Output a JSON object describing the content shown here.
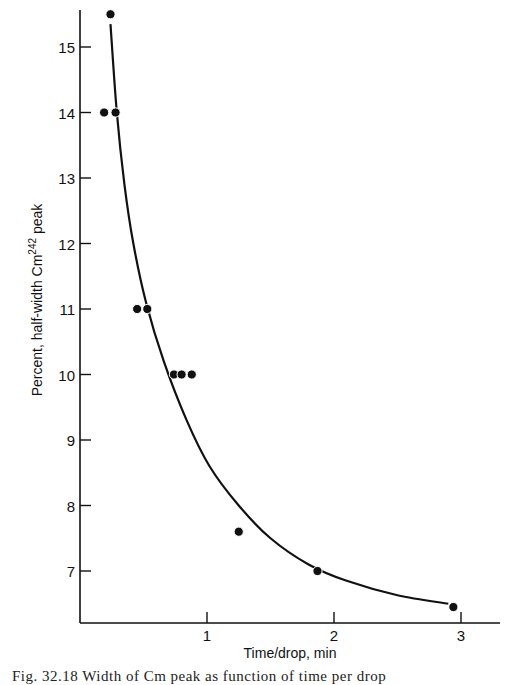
{
  "chart_data": {
    "type": "scatter",
    "title": "",
    "xlabel": "Time/drop, min",
    "ylabel": "Percent, half-width Cm",
    "ylabel_superscript": "242",
    "ylabel_suffix": " peak",
    "xlim": [
      0,
      3.3
    ],
    "ylim": [
      6.2,
      15.6
    ],
    "grid": false,
    "legend": null,
    "x_ticks": [
      1,
      2,
      3
    ],
    "y_ticks": [
      7,
      8,
      9,
      10,
      11,
      12,
      13,
      14,
      15
    ],
    "series": [
      {
        "name": "measured",
        "style": "points",
        "points": [
          {
            "x": 0.24,
            "y": 15.5
          },
          {
            "x": 0.19,
            "y": 14.0
          },
          {
            "x": 0.28,
            "y": 14.0
          },
          {
            "x": 0.45,
            "y": 11.0
          },
          {
            "x": 0.53,
            "y": 11.0
          },
          {
            "x": 0.74,
            "y": 10.0
          },
          {
            "x": 0.8,
            "y": 10.0
          },
          {
            "x": 0.88,
            "y": 10.0
          },
          {
            "x": 1.25,
            "y": 7.6
          },
          {
            "x": 1.87,
            "y": 7.0
          },
          {
            "x": 2.94,
            "y": 6.45
          }
        ]
      },
      {
        "name": "fitted curve",
        "style": "line",
        "points": [
          {
            "x": 0.24,
            "y": 15.35
          },
          {
            "x": 0.29,
            "y": 14.0
          },
          {
            "x": 0.35,
            "y": 12.9
          },
          {
            "x": 0.42,
            "y": 12.0
          },
          {
            "x": 0.52,
            "y": 11.1
          },
          {
            "x": 0.66,
            "y": 10.2
          },
          {
            "x": 0.84,
            "y": 9.3
          },
          {
            "x": 1.02,
            "y": 8.6
          },
          {
            "x": 1.25,
            "y": 8.0
          },
          {
            "x": 1.5,
            "y": 7.5
          },
          {
            "x": 1.8,
            "y": 7.1
          },
          {
            "x": 2.1,
            "y": 6.85
          },
          {
            "x": 2.5,
            "y": 6.63
          },
          {
            "x": 2.9,
            "y": 6.5
          }
        ]
      }
    ]
  },
  "caption": "Fig. 32.18  Width of Cm peak as function of time per drop"
}
